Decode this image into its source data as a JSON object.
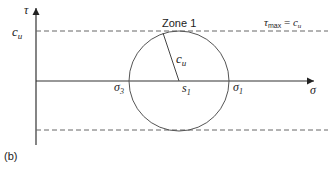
{
  "diagram": {
    "panel_label": "(b)",
    "axes": {
      "y_label": "τ",
      "x_label": "σ",
      "y_tick_label": {
        "main": "c",
        "sub": "u"
      }
    },
    "zone_label": "Zone 1",
    "limit_label": {
      "tau": "τ",
      "sub": "max",
      "eq": " = ",
      "c": "c",
      "c_sub": "u"
    },
    "radius_label": {
      "main": "c",
      "sub": "u"
    },
    "points": {
      "sigma3": {
        "main": "σ",
        "sub": "3"
      },
      "s1": {
        "main": "s",
        "sub": "1"
      },
      "sigma1": {
        "main": "σ",
        "sub": "1"
      }
    },
    "colors": {
      "line": "#333333",
      "dashed": "#555555",
      "circle": "#555555"
    }
  }
}
